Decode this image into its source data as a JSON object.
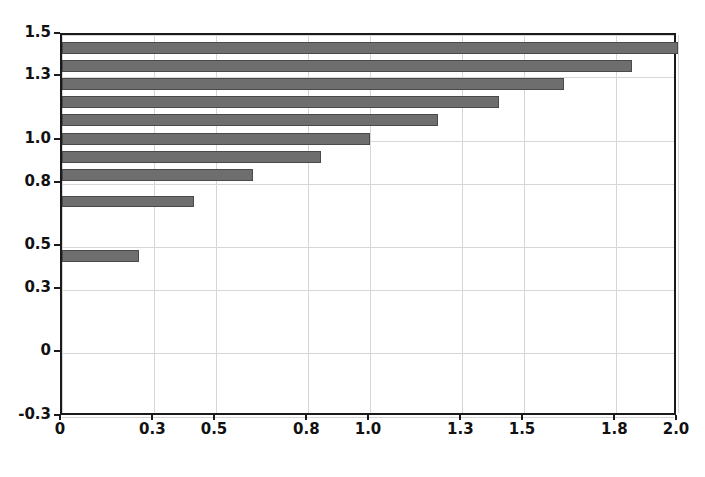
{
  "chart_data": {
    "type": "bar",
    "orientation": "horizontal",
    "title": "",
    "xlabel": "",
    "ylabel": "",
    "xlim": [
      0,
      2.0
    ],
    "ylim": [
      -0.3,
      1.5
    ],
    "grid": true,
    "legend": null,
    "bar_color": "#6e6e6e",
    "bar_edge_color": "#4a4a4a",
    "background_color": "#ffffff",
    "axis_color": "#1a1a1a",
    "gridline_color": "#d6d6d6",
    "xticks": [
      {
        "value": 0,
        "label": "0"
      },
      {
        "value": 0.3,
        "label": "0.3"
      },
      {
        "value": 0.5,
        "label": "0.5"
      },
      {
        "value": 0.8,
        "label": "0.8"
      },
      {
        "value": 1.0,
        "label": "1.0"
      },
      {
        "value": 1.3,
        "label": "1.3"
      },
      {
        "value": 1.5,
        "label": "1.5"
      },
      {
        "value": 1.8,
        "label": "1.8"
      },
      {
        "value": 2.0,
        "label": "2.0"
      }
    ],
    "yticks": [
      {
        "value": 1.5,
        "label": "1.5"
      },
      {
        "value": 1.3,
        "label": "1.3"
      },
      {
        "value": 1.0,
        "label": "1.0"
      },
      {
        "value": 0.8,
        "label": "0.8"
      },
      {
        "value": 0.5,
        "label": "0.5"
      },
      {
        "value": 0.3,
        "label": "0.3"
      },
      {
        "value": 0,
        "label": "0"
      },
      {
        "value": -0.3,
        "label": "-0.3"
      }
    ],
    "categories": [
      1.44,
      1.355,
      1.27,
      1.185,
      1.1,
      1.01,
      0.925,
      0.84,
      0.715,
      0.46
    ],
    "values": [
      2.0,
      1.85,
      1.63,
      1.42,
      1.22,
      1.0,
      0.84,
      0.62,
      0.43,
      0.25
    ],
    "bar_thickness": 0.055
  }
}
